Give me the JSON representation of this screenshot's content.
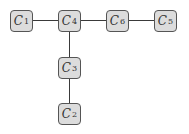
{
  "diagram": {
    "type": "tree",
    "nodes": [
      {
        "id": "C1",
        "letter": "C",
        "sub": "1",
        "x": 10,
        "y": 10
      },
      {
        "id": "C4",
        "letter": "C",
        "sub": "4",
        "x": 58,
        "y": 10
      },
      {
        "id": "C6",
        "letter": "C",
        "sub": "6",
        "x": 106,
        "y": 10
      },
      {
        "id": "C5",
        "letter": "C",
        "sub": "5",
        "x": 154,
        "y": 10
      },
      {
        "id": "C3",
        "letter": "C",
        "sub": "3",
        "x": 58,
        "y": 57
      },
      {
        "id": "C2",
        "letter": "C",
        "sub": "2",
        "x": 58,
        "y": 103
      }
    ],
    "edges": [
      [
        "C1",
        "C4"
      ],
      [
        "C4",
        "C6"
      ],
      [
        "C6",
        "C5"
      ],
      [
        "C4",
        "C3"
      ],
      [
        "C3",
        "C2"
      ]
    ],
    "colors": {
      "node_fill": "#dcdcdc",
      "node_border": "#555555",
      "edge": "#3a3a3a"
    }
  }
}
